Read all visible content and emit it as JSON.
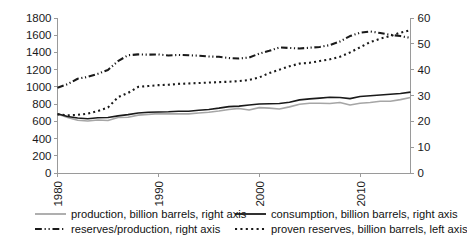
{
  "chart_data": {
    "type": "line",
    "title": "",
    "xlabel": "",
    "ylabel": "",
    "grid": false,
    "legend_position": "bottom",
    "x": [
      1980,
      1981,
      1982,
      1983,
      1984,
      1985,
      1986,
      1987,
      1988,
      1989,
      1990,
      1991,
      1992,
      1993,
      1994,
      1995,
      1996,
      1997,
      1998,
      1999,
      2000,
      2001,
      2002,
      2003,
      2004,
      2005,
      2006,
      2007,
      2008,
      2009,
      2010,
      2011,
      2012,
      2013,
      2014,
      2015
    ],
    "left_axis": {
      "label": "",
      "ticks": [
        0,
        200,
        400,
        600,
        800,
        1000,
        1200,
        1400,
        1600,
        1800
      ],
      "ylim": [
        0,
        1800
      ]
    },
    "right_axis": {
      "label": "",
      "ticks": [
        0,
        10,
        20,
        30,
        40,
        50,
        60
      ],
      "ylim": [
        0,
        60
      ]
    },
    "series": [
      {
        "name": "production, billion barrels, right axis",
        "axis": "right",
        "style": "solid",
        "color": "#a6a6a6",
        "width": 1.6,
        "values": [
          22.8,
          21.5,
          20.4,
          20.1,
          20.5,
          20.3,
          21.5,
          21.6,
          22.4,
          22.7,
          23.0,
          22.9,
          22.9,
          22.9,
          23.2,
          23.5,
          24.0,
          24.6,
          25.0,
          24.4,
          25.3,
          25.1,
          24.8,
          25.6,
          26.6,
          27.0,
          27.0,
          26.9,
          27.3,
          26.3,
          27.0,
          27.3,
          27.8,
          27.8,
          28.4,
          29.2
        ]
      },
      {
        "name": "consumption, billion barrels, right axis",
        "axis": "right",
        "style": "solid",
        "color": "#1a1a1a",
        "width": 1.6,
        "values": [
          22.9,
          21.9,
          21.3,
          21.0,
          21.4,
          21.5,
          22.1,
          22.6,
          23.2,
          23.5,
          23.6,
          23.7,
          23.9,
          23.9,
          24.3,
          24.6,
          25.1,
          25.7,
          25.9,
          26.3,
          26.7,
          26.8,
          26.9,
          27.4,
          28.3,
          28.7,
          29.0,
          29.3,
          29.2,
          28.8,
          29.6,
          29.9,
          30.2,
          30.5,
          30.8,
          31.3
        ]
      },
      {
        "name": "reserves/production, right axis",
        "axis": "right",
        "style": "dashdotdot",
        "color": "#1a1a1a",
        "width": 2.1,
        "values": [
          33.0,
          34.4,
          36.5,
          37.2,
          38.4,
          39.9,
          43.3,
          45.6,
          45.9,
          45.8,
          45.9,
          45.5,
          45.7,
          45.6,
          45.4,
          45.1,
          45.0,
          44.5,
          44.3,
          44.7,
          46.2,
          47.3,
          48.6,
          48.4,
          48.2,
          48.5,
          48.8,
          49.5,
          50.9,
          53.0,
          54.3,
          54.8,
          54.2,
          53.5,
          53.0,
          52.3
        ]
      },
      {
        "name": "proven reserves, billion barrels, left axis",
        "axis": "left",
        "style": "dotted",
        "color": "#1a1a1a",
        "width": 2.1,
        "values": [
          680,
          670,
          675,
          690,
          720,
          760,
          880,
          930,
          1000,
          1010,
          1020,
          1025,
          1035,
          1040,
          1045,
          1050,
          1055,
          1060,
          1068,
          1080,
          1110,
          1160,
          1200,
          1240,
          1270,
          1280,
          1300,
          1320,
          1350,
          1400,
          1460,
          1520,
          1560,
          1590,
          1630,
          1660
        ]
      }
    ],
    "x_ticks": [
      1980,
      1990,
      2000,
      2010
    ],
    "legend": [
      {
        "label": "production, billion barrels, right axis",
        "style": "solid",
        "color": "#a6a6a6"
      },
      {
        "label": "consumption, billion barrels, right axis",
        "style": "solid",
        "color": "#1a1a1a"
      },
      {
        "label": "reserves/production, right axis",
        "style": "dashdotdot",
        "color": "#1a1a1a"
      },
      {
        "label": "proven reserves, billion barrels, left axis",
        "style": "dotted",
        "color": "#1a1a1a"
      }
    ]
  }
}
